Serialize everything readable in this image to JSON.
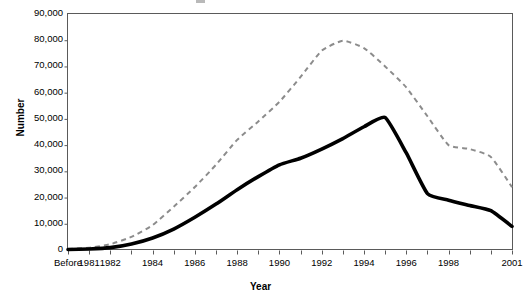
{
  "chart_data": {
    "type": "line",
    "title": "",
    "xlabel": "Year",
    "ylabel": "Number",
    "ylim": [
      0,
      90000
    ],
    "ytick_labels": [
      "90,000",
      "80,000",
      "70,000",
      "60,000",
      "50,000",
      "40,000",
      "30,000",
      "20,000",
      "10,000",
      "0"
    ],
    "ytick_values": [
      90000,
      80000,
      70000,
      60000,
      50000,
      40000,
      30000,
      20000,
      10000,
      0
    ],
    "categories": [
      "Before 1981",
      "1981",
      "1982",
      "1983",
      "1984",
      "1985",
      "1986",
      "1987",
      "1988",
      "1989",
      "1990",
      "1991",
      "1992",
      "1993",
      "1994",
      "1995",
      "1996",
      "1997",
      "1998",
      "1999",
      "2000",
      "2001"
    ],
    "xtick_labels": [
      "Before",
      "1981",
      "1982",
      "1984",
      "1986",
      "1988",
      "1990",
      "1992",
      "1994",
      "1996",
      "1998",
      "2001"
    ],
    "xtick_label_indices": [
      0,
      1,
      2,
      4,
      6,
      8,
      10,
      12,
      14,
      16,
      18,
      21
    ],
    "grid": false,
    "legend_position": "inline-annotations",
    "series": [
      {
        "name": "Cases diagnosed",
        "style": "dashed",
        "color": "#8c8c8c",
        "label_x_index": 18.4,
        "label_y_value": 55000,
        "values": [
          400,
          900,
          2200,
          5000,
          9500,
          16500,
          24000,
          32500,
          42000,
          49000,
          56500,
          66000,
          76000,
          79800,
          77000,
          70000,
          62000,
          51000,
          40000,
          38500,
          35500,
          24000
        ]
      },
      {
        "name": "Deaths",
        "style": "solid",
        "color": "#000000",
        "label_x_index": 9.1,
        "label_y_value": 26500,
        "values": [
          200,
          400,
          900,
          2300,
          4600,
          8000,
          12500,
          17500,
          23000,
          28000,
          32500,
          35000,
          38500,
          42500,
          47000,
          50500,
          37000,
          21500,
          19000,
          17000,
          15000,
          9000
        ]
      }
    ],
    "annotations": [
      {
        "text": "Cases diagnosed",
        "x": 428,
        "y": 101
      },
      {
        "text": "Deaths",
        "x": 248,
        "y": 190
      }
    ]
  }
}
